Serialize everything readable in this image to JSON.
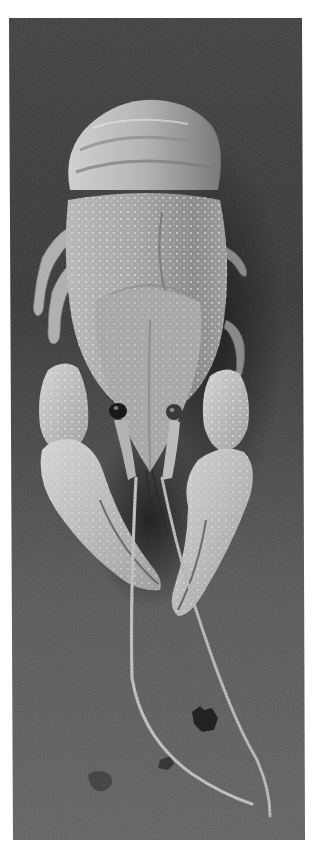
{
  "image": {
    "subject": "Crayfish (freshwater lobster) photographed head-on on a dark slate surface",
    "style": "black-and-white photograph with white border",
    "alt": "Black and white photo of a crayfish facing the camera with claws forward and long antennae trailing down"
  },
  "colors": {
    "page_background": "#ffffff",
    "surface_dark": "#383838",
    "surface_mid": "#4d4d4d",
    "surface_light": "#626262",
    "shell_light": "#c8c8c8",
    "shell_mid": "#9a9a9a",
    "shell_dark": "#6e6e6e",
    "eye": "#1a1a1a"
  }
}
